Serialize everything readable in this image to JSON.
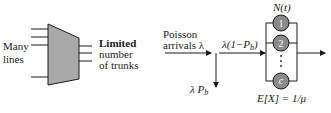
{
  "left_panel": {
    "input_label": [
      "Many",
      "lines"
    ],
    "output_label": {
      "line1": "Limited",
      "line2": "number",
      "line3": "of trunks"
    },
    "input_line_count": 4,
    "output_line_count": 3
  },
  "right_panel": {
    "arrival_label": [
      "Poisson",
      "arrivals λ"
    ],
    "admitted_label": "λ(1−P",
    "admitted_sub": "b",
    "admitted_close": ")",
    "blocked_label": "λ P",
    "blocked_sub": "b",
    "count_label": "N(t)",
    "servers": [
      "1",
      "2",
      "c"
    ],
    "ellipsis": "⋮",
    "service_label": "E[X] = 1/μ"
  },
  "colors": {
    "trapezoid_fill": "#a9a9a9",
    "server_fill": "#8a8a8a",
    "line": "#1a1a1a"
  }
}
